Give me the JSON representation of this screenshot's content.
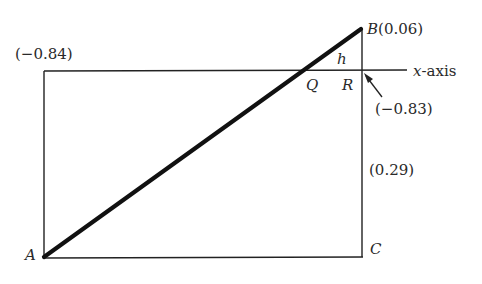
{
  "diagram": {
    "points": {
      "A": {
        "label": "A"
      },
      "B": {
        "label": "B(0.06)"
      },
      "C": {
        "label": "C"
      },
      "Q": {
        "label": "Q"
      },
      "R": {
        "label": "R"
      }
    },
    "segment_label": "h",
    "axis_label": "x-axis",
    "values": {
      "top_left": "(−0.84)",
      "r_point": "(−0.83)",
      "right_side": "(0.29)"
    },
    "colors": {
      "line": "#111111",
      "text": "#2a2a2a",
      "background": "#ffffff"
    }
  }
}
